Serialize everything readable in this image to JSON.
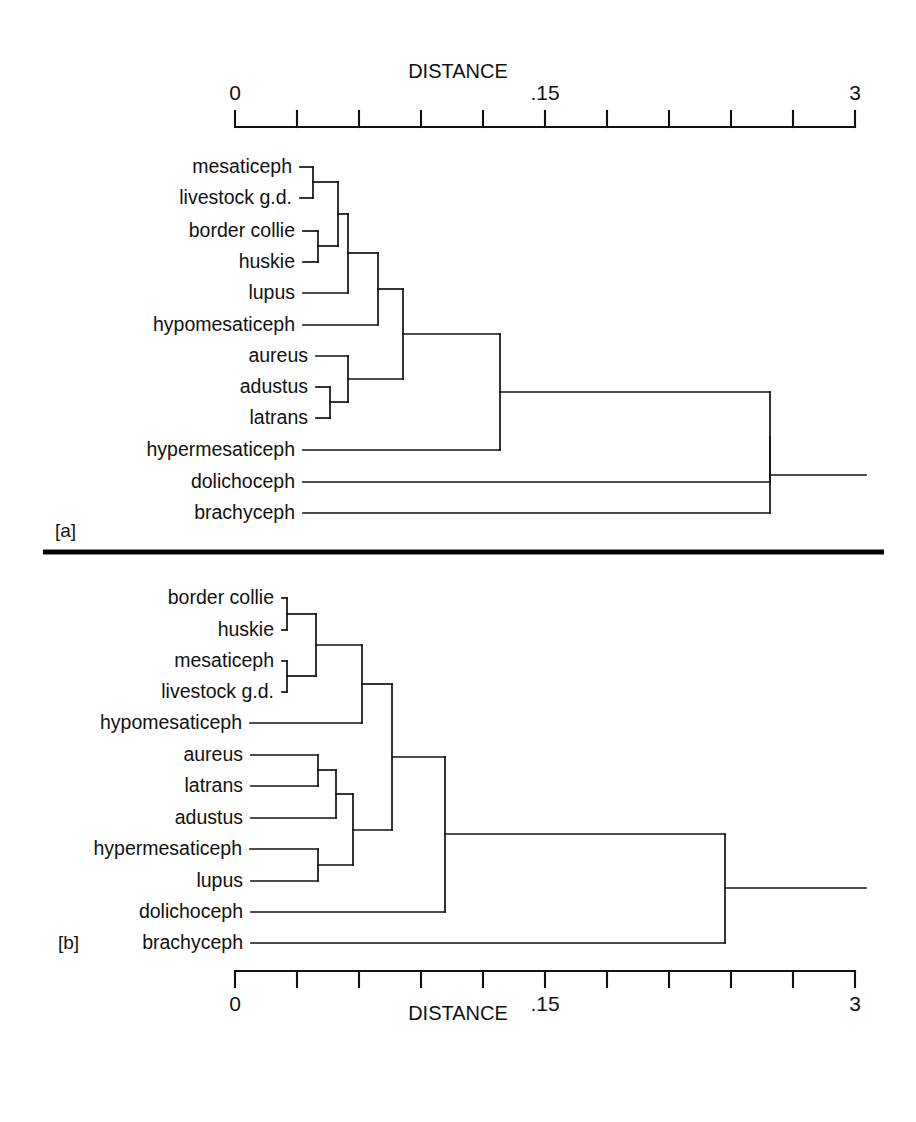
{
  "figure": {
    "type": "dendrogram-pair",
    "background_color": "#ffffff",
    "line_color": "#111111",
    "width": 916,
    "height": 1122
  },
  "panel_a": {
    "id_label": "[a]",
    "axis": {
      "title": "DISTANCE",
      "position": "top",
      "tick_labels": [
        "0",
        ".15",
        "3"
      ],
      "tick_label_positions": [
        0,
        5,
        10
      ],
      "n_ticks": 11,
      "x_start_px": 235,
      "x_end_px": 855,
      "y_px": 127,
      "range": [
        0,
        3
      ],
      "mid_label_value": 0.15
    },
    "leaves": [
      "mesaticeph",
      "livestock g.d.",
      "border collie",
      "huskie",
      "lupus",
      "hypomesaticeph",
      "aureus",
      "adustus",
      "latrans",
      "hypermesaticeph",
      "dolichoceph",
      "brachyceph"
    ],
    "leaf_y_px": [
      167,
      198,
      231,
      262,
      293,
      325,
      356,
      387,
      418,
      450,
      482,
      513
    ],
    "leaf_x_start_px": [
      300,
      300,
      303,
      303,
      303,
      303,
      316,
      316,
      316,
      303,
      303,
      303
    ],
    "merges": [
      {
        "name": "mesaticeph+livestock",
        "x_px": 313,
        "y_top_px": 167,
        "y_bot_px": 198,
        "y_mid_px": 182
      },
      {
        "name": "border-collie+huskie",
        "x_px": 318,
        "y_top_px": 231,
        "y_bot_px": 262,
        "y_mid_px": 246
      },
      {
        "name": "dogs4",
        "x_px": 338,
        "y_top_px": 182,
        "y_bot_px": 246,
        "y_mid_px": 214
      },
      {
        "name": "dogs4+lupus",
        "x_px": 348,
        "y_top_px": 214,
        "y_bot_px": 293,
        "y_mid_px": 253
      },
      {
        "name": "clade+hypomesaticeph",
        "x_px": 378,
        "y_top_px": 253,
        "y_bot_px": 325,
        "y_mid_px": 289
      },
      {
        "name": "adustus+latrans",
        "x_px": 330,
        "y_top_px": 387,
        "y_bot_px": 418,
        "y_mid_px": 402
      },
      {
        "name": "aureus+jackals",
        "x_px": 348,
        "y_top_px": 356,
        "y_bot_px": 402,
        "y_mid_px": 379
      },
      {
        "name": "wolves+jackals",
        "x_px": 403,
        "y_top_px": 289,
        "y_bot_px": 379,
        "y_mid_px": 334
      },
      {
        "name": "clade+hypermesaticeph",
        "x_px": 500,
        "y_top_px": 334,
        "y_bot_px": 450,
        "y_mid_px": 392
      },
      {
        "name": "clade+dolichoceph",
        "x_px": 770,
        "y_top_px": 392,
        "y_bot_px": 482,
        "y_mid_px": 437
      },
      {
        "name": "root",
        "x_px": 770,
        "y_top_px": 437,
        "y_bot_px": 513,
        "y_mid_px": 475
      }
    ],
    "root_stub_end_px": 866
  },
  "panel_b": {
    "id_label": "[b]",
    "axis": {
      "title": "DISTANCE",
      "position": "bottom",
      "tick_labels": [
        "0",
        ".15",
        "3"
      ],
      "tick_label_positions": [
        0,
        5,
        10
      ],
      "n_ticks": 11,
      "x_start_px": 235,
      "x_end_px": 855,
      "y_px": 971,
      "range": [
        0,
        3
      ],
      "mid_label_value": 0.15
    },
    "leaves": [
      "border collie",
      "huskie",
      "mesaticeph",
      "livestock g.d.",
      "hypomesaticeph",
      "aureus",
      "latrans",
      "adustus",
      "hypermesaticeph",
      "lupus",
      "dolichoceph",
      "brachyceph"
    ],
    "leaf_y_px": [
      598,
      630,
      661,
      692,
      723,
      755,
      786,
      818,
      849,
      881,
      912,
      943
    ],
    "leaf_x_start_px": [
      282,
      282,
      282,
      282,
      250,
      251,
      251,
      251,
      250,
      251,
      251,
      251
    ],
    "merges": [
      {
        "name": "border-collie+huskie",
        "x_px": 287,
        "y_top_px": 598,
        "y_bot_px": 630,
        "y_mid_px": 614
      },
      {
        "name": "mesaticeph+livestock",
        "x_px": 287,
        "y_top_px": 661,
        "y_bot_px": 692,
        "y_mid_px": 676
      },
      {
        "name": "dogs4",
        "x_px": 316,
        "y_top_px": 614,
        "y_bot_px": 676,
        "y_mid_px": 645
      },
      {
        "name": "dogs4+hypomesaticeph",
        "x_px": 362,
        "y_top_px": 645,
        "y_bot_px": 723,
        "y_mid_px": 684
      },
      {
        "name": "aureus+latrans",
        "x_px": 318,
        "y_top_px": 755,
        "y_bot_px": 786,
        "y_mid_px": 770
      },
      {
        "name": "jackals+adustus",
        "x_px": 336,
        "y_top_px": 770,
        "y_bot_px": 818,
        "y_mid_px": 794
      },
      {
        "name": "hypermesaticeph+lupus",
        "x_px": 318,
        "y_top_px": 849,
        "y_bot_px": 881,
        "y_mid_px": 865
      },
      {
        "name": "jackals+wolfclade",
        "x_px": 353,
        "y_top_px": 794,
        "y_bot_px": 865,
        "y_mid_px": 830
      },
      {
        "name": "upper+lower",
        "x_px": 392,
        "y_top_px": 684,
        "y_bot_px": 830,
        "y_mid_px": 757
      },
      {
        "name": "clade+dolichoceph",
        "x_px": 445,
        "y_top_px": 757,
        "y_bot_px": 912,
        "y_mid_px": 834
      },
      {
        "name": "root",
        "x_px": 725,
        "y_top_px": 834,
        "y_bot_px": 943,
        "y_mid_px": 888
      }
    ],
    "root_stub_end_px": 866
  },
  "divider": {
    "y_px": 552,
    "x_start_px": 43,
    "x_end_px": 884
  }
}
